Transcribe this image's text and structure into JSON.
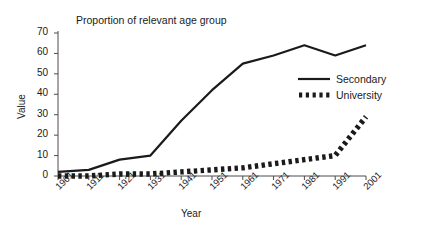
{
  "chart_data": {
    "type": "line",
    "title": "Proportion of relevant age group",
    "xlabel": "Year",
    "ylabel": "Value",
    "categories": [
      "1901",
      "1911",
      "1921",
      "1931",
      "1941",
      "1951",
      "1961",
      "1971",
      "1981",
      "1991",
      "2001"
    ],
    "ylim": [
      0,
      70
    ],
    "yticks": [
      "0",
      "10",
      "20",
      "30",
      "40",
      "50",
      "60",
      "70"
    ],
    "grid": false,
    "legend_position": "right-middle",
    "series": [
      {
        "name": "Secondary",
        "style": "solid",
        "color": "#1a1a1a",
        "values": [
          2,
          3,
          8,
          10,
          27,
          42,
          55,
          59,
          64,
          59,
          64
        ]
      },
      {
        "name": "University",
        "style": "thick-dashed",
        "color": "#1a1a1a",
        "values": [
          0,
          0,
          1,
          1,
          2,
          3,
          4,
          6,
          8,
          10,
          29
        ]
      }
    ]
  },
  "legend": {
    "entries": [
      {
        "label": "Secondary"
      },
      {
        "label": "University"
      }
    ]
  }
}
